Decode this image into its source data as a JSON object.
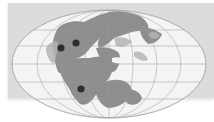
{
  "map": {
    "projection": "mollweide-style world map",
    "subject": "paleogeographic supercontinent (Pangaea)",
    "colors": {
      "panel_background": "#dcdcdc",
      "ocean": "#f4f4f4",
      "land": "#8e8e8e",
      "land_light": "#b4b4b4",
      "graticule": "#9a9a9a",
      "marker": "#2e2e2e"
    },
    "markers": [
      {
        "id": "marker-1",
        "x": 61,
        "y": 48
      },
      {
        "id": "marker-2",
        "x": 76,
        "y": 43
      },
      {
        "id": "marker-3",
        "x": 81,
        "y": 89
      }
    ]
  }
}
